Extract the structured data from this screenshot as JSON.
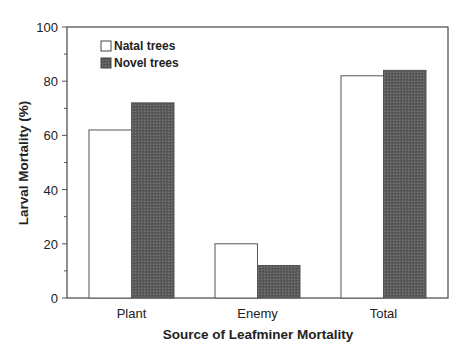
{
  "chart_data": {
    "type": "bar",
    "title": "",
    "xlabel": "Source of Leafminer Mortality",
    "ylabel": "Larval Mortality (%)",
    "ylim": [
      0,
      100
    ],
    "yticks": [
      0,
      20,
      40,
      60,
      80,
      100
    ],
    "categories": [
      "Plant",
      "Enemy",
      "Total"
    ],
    "series": [
      {
        "name": "Natal trees",
        "color": "#ffffff",
        "values": [
          62,
          20,
          82
        ]
      },
      {
        "name": "Novel trees",
        "color": "#5a5a5a",
        "values": [
          72,
          12,
          84
        ]
      }
    ],
    "legend_position": "upper-left-inside",
    "grid": false
  },
  "colors": {
    "axis": "#555555",
    "natal_fill": "#ffffff",
    "novel_fill": "#5a5a5a",
    "bar_stroke": "#555555"
  }
}
